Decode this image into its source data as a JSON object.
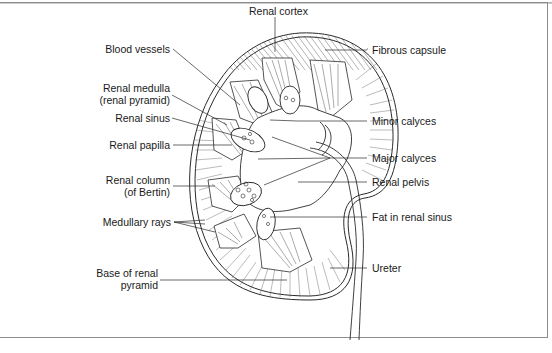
{
  "diagram": {
    "colors": {
      "line": "#2a2a2a",
      "frame": "#8c8c8c",
      "text": "#1a1a1a",
      "background": "#ffffff"
    },
    "labels_top": [
      {
        "id": "renal-cortex",
        "text": "Renal cortex"
      }
    ],
    "labels_left": [
      {
        "id": "blood-vessels",
        "text": "Blood vessels"
      },
      {
        "id": "renal-medulla",
        "line1": "Renal medulla",
        "line2": "(renal pyramid)"
      },
      {
        "id": "renal-sinus",
        "text": "Renal sinus"
      },
      {
        "id": "renal-papilla",
        "text": "Renal papilla"
      },
      {
        "id": "renal-column",
        "line1": "Renal column",
        "line2": "(of Bertin)"
      },
      {
        "id": "medullary-rays",
        "text": "Medullary rays"
      },
      {
        "id": "base-of-renal-pyramid",
        "line1": "Base of renal",
        "line2": "pyramid"
      }
    ],
    "labels_right": [
      {
        "id": "fibrous-capsule",
        "text": "Fibrous capsule"
      },
      {
        "id": "minor-calyces",
        "text": "Minor calyces"
      },
      {
        "id": "major-calyces",
        "text": "Major calyces"
      },
      {
        "id": "renal-pelvis",
        "text": "Renal pelvis"
      },
      {
        "id": "fat-in-renal-sinus",
        "text": "Fat in renal sinus"
      },
      {
        "id": "ureter",
        "text": "Ureter"
      }
    ]
  }
}
